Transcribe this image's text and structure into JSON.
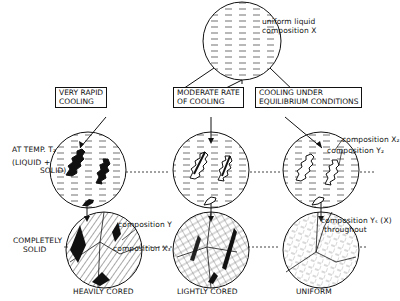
{
  "diagram": {
    "top": {
      "label_line1": "uniform liquid",
      "label_line2": "composition X"
    },
    "paths": [
      {
        "label_line1": "VERY RAPID",
        "label_line2": "COOLING",
        "result": "HEAVILY CORED"
      },
      {
        "label_line1": "MODERATE RATE",
        "label_line2": "OF COOLING",
        "result": "LIGHTLY CORED"
      },
      {
        "label_line1": "COOLING UNDER",
        "label_line2": "EQUILIBRIUM CONDITIONS",
        "result": "UNIFORM"
      }
    ],
    "rows": {
      "middle_line1": "AT TEMP. T₂",
      "middle_line2": "(LIQUID  +",
      "middle_line3": "SOLID)",
      "bottom_line1": "COMPLETELY",
      "bottom_line2": "SOLID"
    },
    "annotations": {
      "comp_x2": "composition X₂",
      "comp_y2": "composition Y₂",
      "comp_y": "composition Y",
      "comp_x3": "composition X₃",
      "comp_ys_line1": "composition Yₛ (X)",
      "comp_ys_line2": "throughout"
    },
    "colors": {
      "ink": "#111111",
      "background": "#ffffff"
    }
  }
}
